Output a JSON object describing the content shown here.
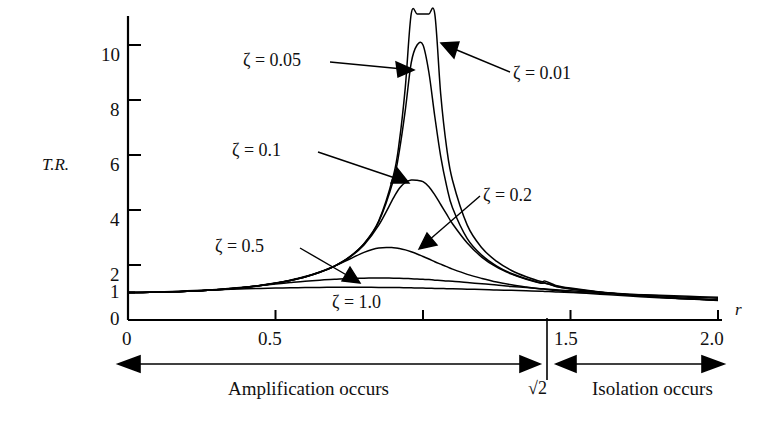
{
  "figure": {
    "axis_labels": {
      "y": "T.R.",
      "x": "r"
    },
    "y_ticks": [
      "0",
      "1",
      "2",
      "4",
      "6",
      "8",
      "10"
    ],
    "x_ticks": [
      "0",
      "0.5",
      "1.0",
      "1.5",
      "2.0"
    ]
  },
  "curve_labels": [
    {
      "id": "z001",
      "text": "ζ = 0.01"
    },
    {
      "id": "z005",
      "text": "ζ = 0.05"
    },
    {
      "id": "z01",
      "text": "ζ = 0.1"
    },
    {
      "id": "z02",
      "text": "ζ = 0.2"
    },
    {
      "id": "z05",
      "text": "ζ = 0.5"
    },
    {
      "id": "z10",
      "text": "ζ = 1.0"
    }
  ],
  "annotations": {
    "left_region": "Amplification occurs",
    "right_region": "Isolation occurs",
    "divider": "√2"
  },
  "chart_data": {
    "type": "line",
    "title": "",
    "xlabel": "r",
    "ylabel": "T.R.",
    "xlim": [
      0,
      2.0
    ],
    "ylim": [
      0,
      11
    ],
    "grid": false,
    "legend": "inline-annotations",
    "x_ticks": [
      0,
      0.5,
      1.0,
      1.5,
      2.0
    ],
    "y_ticks": [
      0,
      1,
      2,
      4,
      6,
      8,
      10
    ],
    "x": [
      0,
      0.05,
      0.1,
      0.15,
      0.2,
      0.25,
      0.3,
      0.35,
      0.4,
      0.45,
      0.5,
      0.55,
      0.6,
      0.65,
      0.7,
      0.75,
      0.8,
      0.85,
      0.9,
      0.92,
      0.94,
      0.96,
      0.98,
      1.0,
      1.02,
      1.04,
      1.06,
      1.08,
      1.1,
      1.15,
      1.2,
      1.25,
      1.3,
      1.35,
      1.4,
      1.4142,
      1.45,
      1.5,
      1.6,
      1.7,
      1.8,
      1.9,
      2.0
    ],
    "series": [
      {
        "name": "ζ = 0.01",
        "zeta": 0.01,
        "peak_r": 1.0,
        "peak_value": 50.0,
        "clipped_above_axis": true,
        "values": [
          1.0,
          1.003,
          1.01,
          1.023,
          1.042,
          1.067,
          1.099,
          1.14,
          1.19,
          1.253,
          1.333,
          1.437,
          1.563,
          1.735,
          1.961,
          2.286,
          2.778,
          3.604,
          5.263,
          6.51,
          8.46,
          12.1,
          21.9,
          50.0,
          21.6,
          11.9,
          8.22,
          6.28,
          5.08,
          3.45,
          2.62,
          2.13,
          1.8,
          1.57,
          1.4,
          1.414,
          1.26,
          1.16,
          1.02,
          0.92,
          0.84,
          0.78,
          0.73
        ]
      },
      {
        "name": "ζ = 0.05",
        "zeta": 0.05,
        "peak_r": 0.997,
        "peak_value": 10.0,
        "values": [
          1.0,
          1.003,
          1.01,
          1.023,
          1.042,
          1.067,
          1.099,
          1.14,
          1.19,
          1.253,
          1.334,
          1.437,
          1.563,
          1.735,
          1.96,
          2.284,
          2.771,
          3.575,
          5.1,
          6.16,
          7.63,
          9.35,
          10.0,
          10.0,
          9.0,
          7.4,
          5.95,
          4.88,
          4.08,
          2.96,
          2.35,
          1.96,
          1.69,
          1.5,
          1.35,
          1.35,
          1.23,
          1.14,
          1.01,
          0.91,
          0.83,
          0.77,
          0.72
        ]
      },
      {
        "name": "ζ = 0.1",
        "zeta": 0.1,
        "peak_r": 0.99,
        "peak_value": 5.1,
        "values": [
          1.0,
          1.003,
          1.01,
          1.023,
          1.042,
          1.067,
          1.1,
          1.141,
          1.192,
          1.255,
          1.336,
          1.439,
          1.566,
          1.735,
          1.957,
          2.27,
          2.73,
          3.45,
          4.44,
          4.79,
          5.0,
          5.09,
          5.08,
          5.03,
          4.85,
          4.55,
          4.2,
          3.85,
          3.5,
          2.8,
          2.28,
          1.92,
          1.67,
          1.48,
          1.34,
          1.34,
          1.22,
          1.13,
          1.01,
          0.91,
          0.83,
          0.77,
          0.72
        ]
      },
      {
        "name": "ζ = 0.2",
        "zeta": 0.2,
        "peak_r": 0.96,
        "peak_value": 2.63,
        "values": [
          1.0,
          1.003,
          1.01,
          1.023,
          1.042,
          1.068,
          1.1,
          1.142,
          1.195,
          1.26,
          1.343,
          1.45,
          1.58,
          1.75,
          1.96,
          2.21,
          2.46,
          2.62,
          2.63,
          2.6,
          2.55,
          2.48,
          2.4,
          2.31,
          2.22,
          2.12,
          2.03,
          1.94,
          1.85,
          1.66,
          1.51,
          1.38,
          1.28,
          1.2,
          1.13,
          1.12,
          1.07,
          1.02,
          0.94,
          0.87,
          0.81,
          0.76,
          0.71
        ]
      },
      {
        "name": "ζ = 0.5",
        "zeta": 0.5,
        "peak_r": 0.83,
        "peak_value": 1.53,
        "values": [
          1.0,
          1.004,
          1.012,
          1.027,
          1.048,
          1.076,
          1.111,
          1.152,
          1.2,
          1.253,
          1.307,
          1.36,
          1.41,
          1.45,
          1.48,
          1.51,
          1.52,
          1.53,
          1.52,
          1.52,
          1.51,
          1.5,
          1.49,
          1.48,
          1.47,
          1.45,
          1.44,
          1.42,
          1.41,
          1.36,
          1.32,
          1.27,
          1.22,
          1.18,
          1.14,
          1.13,
          1.1,
          1.06,
          1.0,
          0.94,
          0.88,
          0.83,
          0.79
        ]
      },
      {
        "name": "ζ = 1.0",
        "zeta": 1.0,
        "peak_r": 0.0,
        "peak_value": 1.19,
        "values": [
          1.0,
          1.005,
          1.02,
          1.04,
          1.06,
          1.08,
          1.1,
          1.12,
          1.14,
          1.15,
          1.16,
          1.17,
          1.18,
          1.185,
          1.19,
          1.19,
          1.19,
          1.185,
          1.18,
          1.18,
          1.175,
          1.17,
          1.165,
          1.16,
          1.155,
          1.15,
          1.145,
          1.14,
          1.135,
          1.12,
          1.11,
          1.09,
          1.08,
          1.06,
          1.045,
          1.04,
          1.02,
          1.0,
          0.97,
          0.93,
          0.9,
          0.86,
          0.83
        ]
      }
    ],
    "annotations": [
      {
        "text": "Amplification occurs",
        "range": [
          0,
          1.4142
        ]
      },
      {
        "text": "Isolation occurs",
        "range": [
          1.4142,
          2.0
        ]
      },
      {
        "text": "√2",
        "at_x": 1.4142
      }
    ]
  }
}
